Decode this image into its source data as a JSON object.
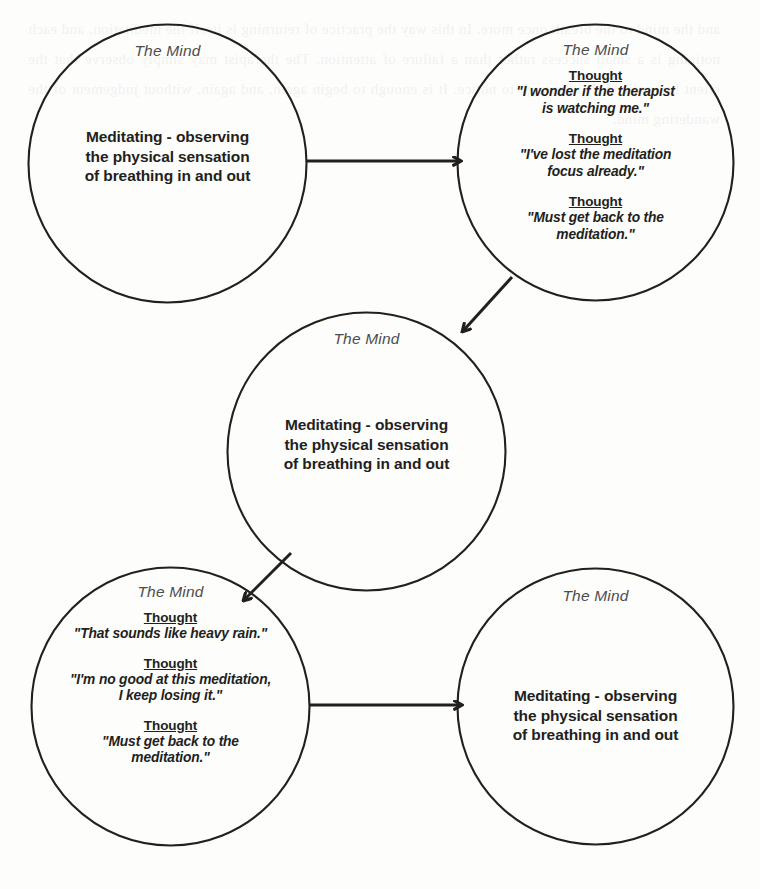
{
  "diagram": {
    "mind_label": "The Mind",
    "thought_label": "Thought",
    "meditation_text": "Meditating - observing\nthe physical sensation\nof breathing in and out",
    "stroke_color": "#231f1c",
    "background_color": "#fdfdfc",
    "nodes": [
      {
        "id": "node-1",
        "mind_label": "The Mind",
        "kind": "meditating",
        "body": "Meditating - observing\nthe physical sensation\nof breathing in and out",
        "thoughts": []
      },
      {
        "id": "node-2",
        "mind_label": "The Mind",
        "kind": "thoughts",
        "body": "",
        "thoughts": [
          {
            "head": "Thought",
            "quote": "\"I wonder if the therapist\nis watching me.\""
          },
          {
            "head": "Thought",
            "quote": "\"I've lost the meditation\nfocus already.\""
          },
          {
            "head": "Thought",
            "quote": "\"Must get back to the\nmeditation.\""
          }
        ]
      },
      {
        "id": "node-3",
        "mind_label": "The Mind",
        "kind": "meditating",
        "body": "Meditating - observing\nthe physical sensation\nof breathing in and out",
        "thoughts": []
      },
      {
        "id": "node-4",
        "mind_label": "The Mind",
        "kind": "thoughts",
        "body": "",
        "thoughts": [
          {
            "head": "Thought",
            "quote": "\"That sounds like heavy rain.\""
          },
          {
            "head": "Thought",
            "quote": "\"I'm no good at this meditation,\nI keep losing it.\""
          },
          {
            "head": "Thought",
            "quote": "\"Must get back to the\nmeditation.\""
          }
        ]
      },
      {
        "id": "node-5",
        "mind_label": "The Mind",
        "kind": "meditating",
        "body": "Meditating - observing\nthe physical sensation\nof breathing in and out",
        "thoughts": []
      }
    ],
    "arrows": [
      {
        "id": "arrow-1",
        "from": "node-1",
        "to": "node-2",
        "direction": "right"
      },
      {
        "id": "arrow-2",
        "from": "node-2",
        "to": "node-3",
        "direction": "down-left"
      },
      {
        "id": "arrow-3",
        "from": "node-3",
        "to": "node-4",
        "direction": "down-left"
      },
      {
        "id": "arrow-4",
        "from": "node-4",
        "to": "node-5",
        "direction": "right"
      }
    ]
  },
  "page_ghost": {
    "text": "and the mind to the breath once more. In this way the practice of returning is itself the meditation, and each noticing is a small success rather than a failure of attention. The therapist may simply observe that the client has noticed. It is enough to notice. It is enough to begin again, and again, without judgement of the wandering mind."
  }
}
